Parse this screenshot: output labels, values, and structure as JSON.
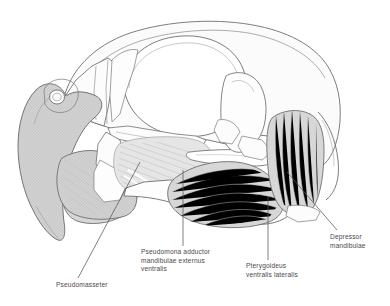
{
  "figure": {
    "background_color": "#ffffff",
    "line_color": "#6e6e6e",
    "muscle_fill_dark": "#d0d0d0",
    "muscle_fill_mid": "#dcdcdc",
    "muscle_fill_light": "#e8e8e8",
    "bone_fill": "#fbfbfb",
    "striation_color": "#bdbdbd",
    "leader_color": "#555555",
    "label_color": "#4a4a4a"
  },
  "labels": {
    "pseudomasseter": "Pseudomasseter",
    "adductor": "Pseudomona adductor\nmandibulae externus\nventralis",
    "pterygoideus": "Pterygoideus\nventralis lateralis",
    "depressor": "Depressor\nmandibulae"
  },
  "parts": [
    {
      "name": "upper-beak-rhamphotheca",
      "label": "upper beak"
    },
    {
      "name": "nostril",
      "label": "nostril"
    },
    {
      "name": "orbit",
      "label": "orbit"
    },
    {
      "name": "cranium",
      "label": "cranium"
    },
    {
      "name": "lower-beak",
      "label": "lower beak"
    },
    {
      "name": "jugal-bar",
      "label": "jugal bar"
    },
    {
      "name": "quadrate",
      "label": "quadrate"
    },
    {
      "name": "mandible",
      "label": "mandible"
    }
  ],
  "muscles": [
    {
      "id": "pseudomasseter",
      "label": "Pseudomasseter"
    },
    {
      "id": "adductor",
      "label": "Pseudomona adductor mandibulae externus ventralis"
    },
    {
      "id": "pterygoideus",
      "label": "Pterygoideus ventralis lateralis"
    },
    {
      "id": "depressor",
      "label": "Depressor mandibulae"
    }
  ]
}
